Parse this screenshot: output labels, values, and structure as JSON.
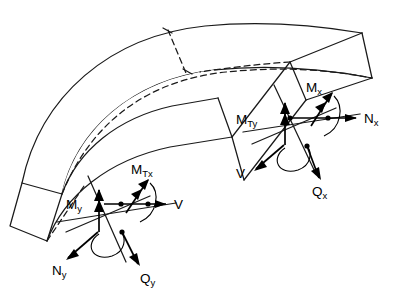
{
  "figure": {
    "kind": "engineering-diagram",
    "colors": {
      "background": "#ffffff",
      "line": "#1a1a1a",
      "vector": "#000000"
    }
  },
  "labels": {
    "left_face": [
      {
        "id": "m-tx",
        "base": "M",
        "subscript": "Tx",
        "kind": "twisting-moment"
      },
      {
        "id": "m-y",
        "base": "M",
        "subscript": "y",
        "kind": "bending-moment"
      },
      {
        "id": "v-left",
        "base": "V",
        "subscript": "",
        "kind": "in-plane-shear"
      },
      {
        "id": "n-y",
        "base": "N",
        "subscript": "y",
        "kind": "normal-force"
      },
      {
        "id": "q-y",
        "base": "Q",
        "subscript": "y",
        "kind": "transverse-shear"
      }
    ],
    "right_face": [
      {
        "id": "m-ty",
        "base": "M",
        "subscript": "Ty",
        "kind": "twisting-moment"
      },
      {
        "id": "m-x",
        "base": "M",
        "subscript": "x",
        "kind": "bending-moment"
      },
      {
        "id": "n-x",
        "base": "N",
        "subscript": "x",
        "kind": "normal-force"
      },
      {
        "id": "v-right",
        "base": "V",
        "subscript": "",
        "kind": "in-plane-shear"
      },
      {
        "id": "q-x",
        "base": "Q",
        "subscript": "x",
        "kind": "transverse-shear"
      }
    ]
  }
}
